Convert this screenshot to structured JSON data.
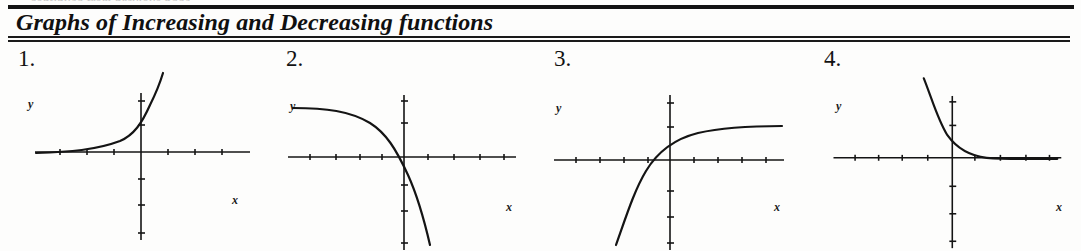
{
  "page": {
    "top_fragment": "continued from previous page",
    "title": "Graphs of Increasing and Decreasing functions",
    "background_color": "#fdfdfc",
    "ink_color": "#111111"
  },
  "graphs": [
    {
      "number": "1.",
      "y_label": "y",
      "x_label": "x",
      "behavior": "increasing",
      "description": "exponential growth curve rising steeply to the right with horizontal asymptote on the left",
      "axes": {
        "origin_x": 141,
        "origin_y": 107,
        "x_min": 35,
        "x_max": 250,
        "y_top": 48,
        "y_bottom": 195,
        "tick_spacing_x": 27,
        "tick_spacing_y": 22
      },
      "curve": "M 36,108 C 70,107 96,105 120,96 C 134,90 142,78 150,60 C 156,48 160,38 163,28"
    },
    {
      "number": "2.",
      "y_label": "y",
      "x_label": "x",
      "behavior": "decreasing",
      "description": "curve flat at upper left then falling steeply downward through the x-axis right of the origin",
      "axes": {
        "origin_x": 136,
        "origin_y": 112,
        "x_min": 20,
        "x_max": 248,
        "y_top": 50,
        "y_bottom": 205,
        "tick_spacing_x": 27,
        "tick_spacing_y": 22
      },
      "curve": "M 25,63 C 58,63 82,66 102,78 C 118,88 128,104 140,130 C 150,152 156,174 162,200"
    },
    {
      "number": "3.",
      "y_label": "y",
      "x_label": "x",
      "behavior": "increasing",
      "description": "curve rising from lower left steeply then levelling off to a horizontal asymptote on the right",
      "axes": {
        "origin_x": 134,
        "origin_y": 115,
        "x_min": 18,
        "x_max": 248,
        "y_top": 50,
        "y_bottom": 205,
        "tick_spacing_x": 27,
        "tick_spacing_y": 22
      },
      "curve": "M 80,200 C 90,172 98,146 110,126 C 122,106 138,94 162,88 C 188,82 218,81 246,81"
    },
    {
      "number": "4.",
      "y_label": "y",
      "x_label": "x",
      "behavior": "decreasing",
      "description": "exponential decay curve falling steeply from the upper left and flattening to a horizontal asymptote on the right",
      "axes": {
        "origin_x": 149,
        "origin_y": 113,
        "x_min": 28,
        "x_max": 260,
        "y_top": 50,
        "y_bottom": 205,
        "tick_spacing_x": 27,
        "tick_spacing_y": 22
      },
      "curve": "M 120,32 C 128,52 134,74 144,90 C 154,104 166,111 184,113 C 206,115 232,114 256,114"
    }
  ]
}
